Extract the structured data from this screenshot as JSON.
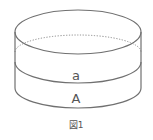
{
  "figure": {
    "caption": "図1",
    "labels": {
      "upper_layer": "a",
      "lower_layer": "A"
    },
    "colors": {
      "stroke": "#707070",
      "dotted": "#8a8a8a",
      "text": "#555555",
      "background": "#ffffff"
    }
  }
}
